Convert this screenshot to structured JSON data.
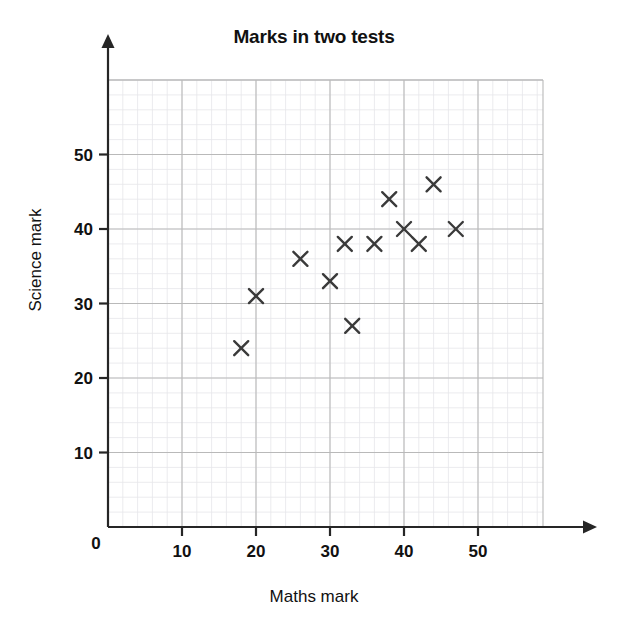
{
  "chart_data": {
    "type": "scatter",
    "title": "Marks in two tests",
    "xlabel": "Maths mark",
    "ylabel": "Science mark",
    "xlim": [
      0,
      60
    ],
    "ylim": [
      0,
      60
    ],
    "xticks": [
      0,
      10,
      20,
      30,
      40,
      50
    ],
    "yticks": [
      0,
      10,
      20,
      30,
      40,
      50
    ],
    "xtick_labels": [
      "0",
      "10",
      "20",
      "30",
      "40",
      "50"
    ],
    "ytick_labels": [
      "10",
      "20",
      "30",
      "40",
      "50"
    ],
    "grid": true,
    "grid_major_step": 10,
    "grid_minor_step": 2,
    "legend": "none",
    "marker": "x",
    "marker_color": "#3a3a3a",
    "grid_major_color": "#b9b9b9",
    "grid_minor_color": "#e6e6ea",
    "axis_color": "#262626",
    "points": [
      {
        "x": 18,
        "y": 24
      },
      {
        "x": 20,
        "y": 31
      },
      {
        "x": 26,
        "y": 36
      },
      {
        "x": 30,
        "y": 33
      },
      {
        "x": 32,
        "y": 38
      },
      {
        "x": 33,
        "y": 27
      },
      {
        "x": 36,
        "y": 38
      },
      {
        "x": 38,
        "y": 44
      },
      {
        "x": 40,
        "y": 40
      },
      {
        "x": 42,
        "y": 38
      },
      {
        "x": 44,
        "y": 46
      },
      {
        "x": 47,
        "y": 40
      }
    ],
    "n_points": 12,
    "series_name": "Marks"
  },
  "axis_zero_label": "0"
}
